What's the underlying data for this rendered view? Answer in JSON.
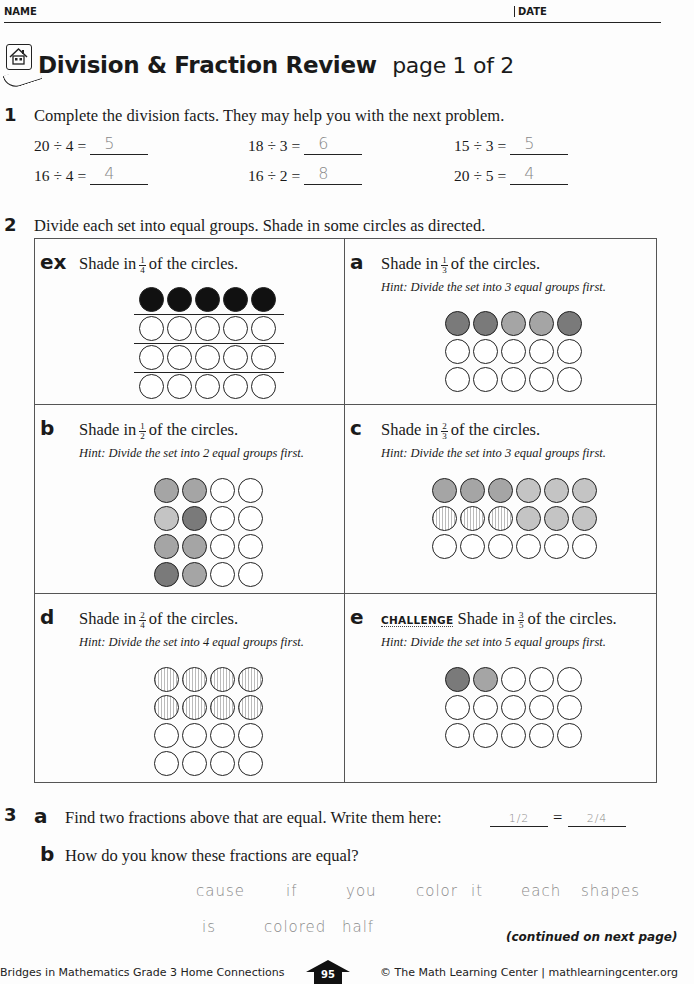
{
  "header": {
    "name_label": "NAME",
    "date_label": "DATE"
  },
  "title": {
    "main": "Division & Fraction Review",
    "sub": "page 1 of 2",
    "icon": "home-connections-house-icon"
  },
  "q1": {
    "number": "1",
    "prompt": "Complete the division facts. They may help you with the next problem.",
    "facts": [
      {
        "expr": "20 ÷ 4 =",
        "answer": "5"
      },
      {
        "expr": "18 ÷ 3 =",
        "answer": "6"
      },
      {
        "expr": "15 ÷ 3 =",
        "answer": "5"
      },
      {
        "expr": "16 ÷ 4 =",
        "answer": "4"
      },
      {
        "expr": "16 ÷ 2 =",
        "answer": "8"
      },
      {
        "expr": "20 ÷ 5 =",
        "answer": "4"
      }
    ]
  },
  "q2": {
    "number": "2",
    "prompt": "Divide each set into equal groups. Shade in some circles as directed.",
    "cells": {
      "ex": {
        "letter": "ex",
        "pre": "Shade in",
        "num": "1",
        "den": "4",
        "post": "of the circles.",
        "hint": ""
      },
      "a": {
        "letter": "a",
        "pre": "Shade in",
        "num": "1",
        "den": "3",
        "post": "of the circles.",
        "hint": "Hint: Divide the set into 3 equal groups first."
      },
      "b": {
        "letter": "b",
        "pre": "Shade in",
        "num": "1",
        "den": "2",
        "post": "of the circles.",
        "hint": "Hint: Divide the set into 2 equal groups first."
      },
      "c": {
        "letter": "c",
        "pre": "Shade in",
        "num": "2",
        "den": "3",
        "post": "of the circles.",
        "hint": "Hint: Divide the set into 3 equal groups first."
      },
      "d": {
        "letter": "d",
        "pre": "Shade in",
        "num": "2",
        "den": "4",
        "post": "of the circles.",
        "hint": "Hint: Divide the set into 4 equal groups first."
      },
      "e": {
        "letter": "e",
        "tag": "CHALLENGE",
        "pre": "Shade in",
        "num": "3",
        "den": "5",
        "post": "of the circles.",
        "hint": "Hint: Divide the set into 5 equal groups first."
      }
    }
  },
  "q3": {
    "number": "3",
    "a": {
      "letter": "a",
      "prompt": "Find two fractions above that are equal. Write them here:",
      "answer1": "1/2",
      "equals": "=",
      "answer2": "2/4"
    },
    "b": {
      "letter": "b",
      "prompt": "How do you know these fractions are equal?",
      "answer_line1": [
        "cause",
        "if",
        "you",
        "color",
        "it",
        "each",
        "shapes"
      ],
      "answer_line2": [
        "is",
        "colored",
        "half"
      ]
    }
  },
  "continued": "(continued on next page)",
  "footer": {
    "left": "Bridges in Mathematics Grade 3 Home Connections",
    "page": "95",
    "right": "© The Math Learning Center | mathlearningcenter.org"
  }
}
